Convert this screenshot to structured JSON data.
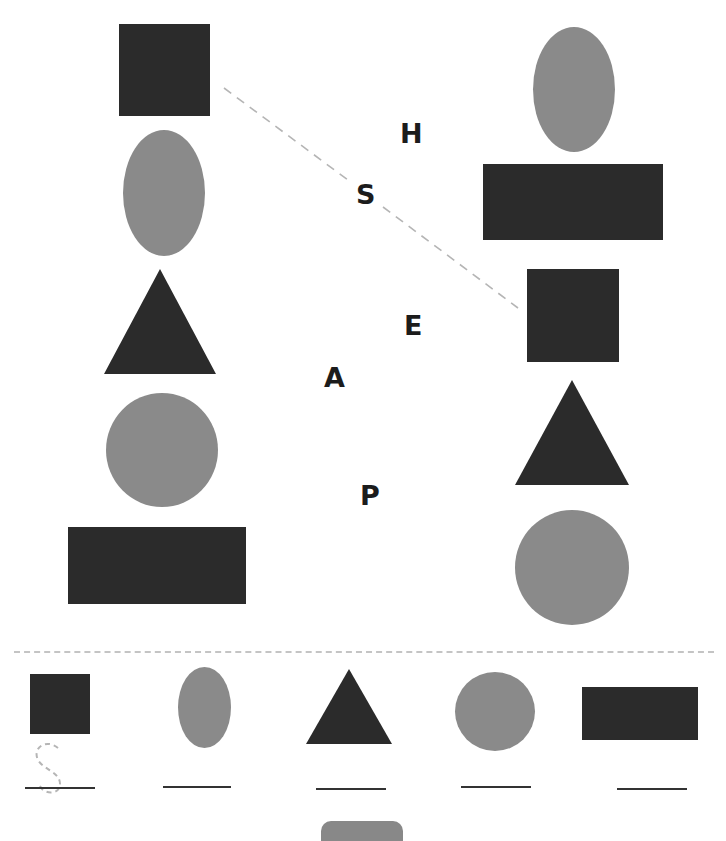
{
  "worksheet": {
    "scattered_letters": [
      "H",
      "S",
      "E",
      "A",
      "P"
    ],
    "trace_letter": "S",
    "left_column": [
      "square",
      "oval",
      "triangle",
      "circle",
      "rectangle"
    ],
    "right_column": [
      "oval",
      "rectangle",
      "square",
      "triangle",
      "circle"
    ],
    "answer_row": [
      "square",
      "oval",
      "triangle",
      "circle",
      "rectangle"
    ],
    "example_match": {
      "from": "left-square",
      "to": "right-square",
      "through_letter": "S"
    },
    "colors": {
      "dark_shape": "#2b2b2b",
      "grey_shape": "#8a8a8a",
      "dashed_line": "#b5b5b5",
      "letters": "#1c1c1c"
    }
  }
}
